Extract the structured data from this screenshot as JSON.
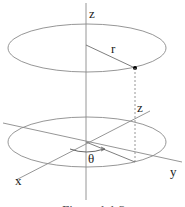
{
  "diagram": {
    "labels": {
      "z_axis_top": "z",
      "radius": "r",
      "z_height": "z",
      "x_axis": "x",
      "y_axis": "y",
      "theta": "θ"
    },
    "caption": "Figure 1.1.3"
  },
  "colors": {
    "line": "#8a8a8a",
    "text": "#222222",
    "point": "#000000"
  }
}
